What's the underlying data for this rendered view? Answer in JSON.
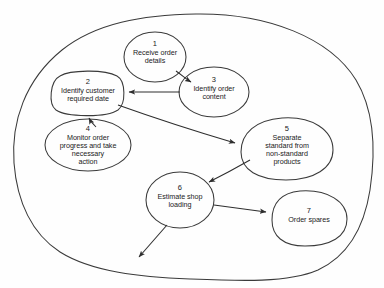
{
  "diagram": {
    "boundary": {
      "name": "system-boundary",
      "shape": "irregular-ellipse",
      "stroke": "#3a3a3a"
    },
    "style": {
      "stroke_color": "#3a3a3a",
      "text_color": "#1b1b1b",
      "background": "#fefefe",
      "fill": "none"
    },
    "nodes": [
      {
        "id": 1,
        "number": "1",
        "lines": [
          "Receive order",
          "details"
        ],
        "cx": 155,
        "cy": 57,
        "rx": 31,
        "ry": 25,
        "shape": "ellipse"
      },
      {
        "id": 2,
        "number": "2",
        "lines": [
          "Identify customer",
          "required date"
        ],
        "cx": 88,
        "cy": 93,
        "rx": 36,
        "ry": 21,
        "shape": "rounded-blob"
      },
      {
        "id": 3,
        "number": "3",
        "lines": [
          "Identify order",
          "content"
        ],
        "cx": 214,
        "cy": 92,
        "rx": 35,
        "ry": 25,
        "shape": "ellipse"
      },
      {
        "id": 4,
        "number": "4",
        "lines": [
          "Monitor order",
          "progress and take",
          "necessary",
          "action"
        ],
        "cx": 88,
        "cy": 145,
        "rx": 43,
        "ry": 26,
        "shape": "ellipse"
      },
      {
        "id": 5,
        "number": "5",
        "lines": [
          "Separate",
          "standard from",
          "non-standard",
          "products"
        ],
        "cx": 287,
        "cy": 148,
        "rx": 46,
        "ry": 30,
        "shape": "blob"
      },
      {
        "id": 6,
        "number": "6",
        "lines": [
          "Estimate shop",
          "loading"
        ],
        "cx": 180,
        "cy": 200,
        "rx": 34,
        "ry": 28,
        "shape": "ellipse"
      },
      {
        "id": 7,
        "number": "7",
        "lines": [
          "Order spares"
        ],
        "cx": 309,
        "cy": 218,
        "rx": 37,
        "ry": 27,
        "shape": "blob"
      }
    ],
    "edges": [
      {
        "name": "edge-1-to-3",
        "from": 1,
        "to": 3,
        "arrow": true
      },
      {
        "name": "edge-3-to-2",
        "from": 3,
        "to": 2,
        "arrow": true
      },
      {
        "name": "edge-2-to-5",
        "from": 2,
        "to": 5,
        "arrow": true
      },
      {
        "name": "edge-4-to-2",
        "from": 4,
        "to": 2,
        "arrow": true
      },
      {
        "name": "edge-5-to-6",
        "from": 5,
        "to": 6,
        "arrow": true
      },
      {
        "name": "edge-6-to-7",
        "from": 6,
        "to": 7,
        "arrow": true
      },
      {
        "name": "edge-6-to-outside",
        "from": 6,
        "to": "external",
        "arrow": true
      }
    ]
  }
}
